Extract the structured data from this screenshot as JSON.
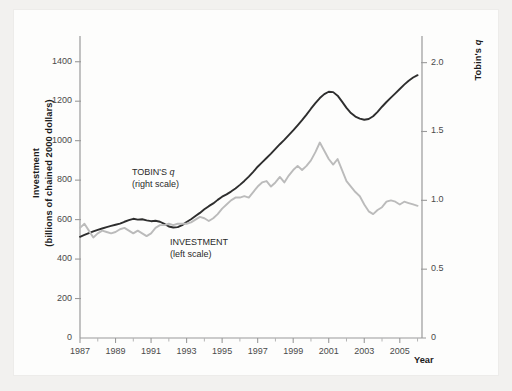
{
  "figure": {
    "background_color": "#fdfdfc",
    "page_color": "#f2f1ef"
  },
  "chart_data": {
    "type": "line",
    "title": "",
    "xlabel": "Year",
    "ylabel": "Investment (billions of chained 2000 dollars)",
    "ylabel_line1": "Investment",
    "ylabel_line2": "(billions of chained 2000 dollars)",
    "ylabel_right_prefix": "Tobin's ",
    "ylabel_right_italic": "q",
    "xlim": [
      1987,
      2006.25
    ],
    "ylim_left": [
      0,
      1500
    ],
    "ylim_right": [
      0,
      2.15
    ],
    "grid": false,
    "legend_position": "inline-annotations",
    "xticks": [
      "1987",
      "1989",
      "1991",
      "1993",
      "1995",
      "1997",
      "1999",
      "2001",
      "2003",
      "2005"
    ],
    "xtick_values": [
      1987,
      1989,
      1991,
      1993,
      1995,
      1997,
      1999,
      2001,
      2003,
      2005
    ],
    "xminor_values": [
      1988,
      1990,
      1992,
      1994,
      1996,
      1998,
      2000,
      2002,
      2004,
      2006
    ],
    "yticks_left": [
      "0",
      "200",
      "400",
      "600",
      "800",
      "1000",
      "1200",
      "1400"
    ],
    "ytick_left_values": [
      0,
      200,
      400,
      600,
      800,
      1000,
      1200,
      1400
    ],
    "yticks_right": [
      "0",
      "0.5",
      "1.0",
      "1.5",
      "2.0"
    ],
    "ytick_right_values": [
      0,
      0.5,
      1.0,
      1.5,
      2.0
    ],
    "series": [
      {
        "name": "INVESTMENT",
        "scale": "left",
        "annotation_line1": "INVESTMENT",
        "annotation_line2": "(left scale)",
        "color": "#2e2e2e",
        "width": 1.9,
        "x": [
          1987.0,
          1987.25,
          1987.5,
          1987.75,
          1988.0,
          1988.25,
          1988.5,
          1988.75,
          1989.0,
          1989.25,
          1989.5,
          1989.75,
          1990.0,
          1990.25,
          1990.5,
          1990.75,
          1991.0,
          1991.25,
          1991.5,
          1991.75,
          1992.0,
          1992.25,
          1992.5,
          1992.75,
          1993.0,
          1993.25,
          1993.5,
          1993.75,
          1994.0,
          1994.25,
          1994.5,
          1994.75,
          1995.0,
          1995.25,
          1995.5,
          1995.75,
          1996.0,
          1996.25,
          1996.5,
          1996.75,
          1997.0,
          1997.25,
          1997.5,
          1997.75,
          1998.0,
          1998.25,
          1998.5,
          1998.75,
          1999.0,
          1999.25,
          1999.5,
          1999.75,
          2000.0,
          2000.25,
          2000.5,
          2000.75,
          2001.0,
          2001.25,
          2001.5,
          2001.75,
          2002.0,
          2002.25,
          2002.5,
          2002.75,
          2003.0,
          2003.25,
          2003.5,
          2003.75,
          2004.0,
          2004.25,
          2004.5,
          2004.75,
          2005.0,
          2005.25,
          2005.5,
          2005.75,
          2006.0
        ],
        "y": [
          513,
          522,
          531,
          540,
          548,
          555,
          562,
          568,
          574,
          580,
          589,
          597,
          604,
          600,
          602,
          596,
          592,
          594,
          589,
          578,
          565,
          560,
          562,
          572,
          588,
          602,
          618,
          634,
          652,
          668,
          682,
          700,
          716,
          728,
          742,
          758,
          776,
          796,
          818,
          842,
          868,
          890,
          912,
          934,
          958,
          982,
          1004,
          1028,
          1052,
          1078,
          1104,
          1132,
          1162,
          1190,
          1216,
          1236,
          1248,
          1246,
          1228,
          1198,
          1166,
          1140,
          1122,
          1112,
          1106,
          1110,
          1124,
          1146,
          1172,
          1196,
          1218,
          1240,
          1262,
          1284,
          1304,
          1320,
          1332
        ]
      },
      {
        "name": "TOBIN'S q",
        "scale": "right",
        "annotation_line1_prefix": "TOBIN'S ",
        "annotation_line1_italic": "q",
        "annotation_line2": "(right scale)",
        "color": "#bbbbbb",
        "width": 1.9,
        "x": [
          1987.0,
          1987.25,
          1987.5,
          1987.75,
          1988.0,
          1988.25,
          1988.5,
          1988.75,
          1989.0,
          1989.25,
          1989.5,
          1989.75,
          1990.0,
          1990.25,
          1990.5,
          1990.75,
          1991.0,
          1991.25,
          1991.5,
          1991.75,
          1992.0,
          1992.25,
          1992.5,
          1992.75,
          1993.0,
          1993.25,
          1993.5,
          1993.75,
          1994.0,
          1994.25,
          1994.5,
          1994.75,
          1995.0,
          1995.25,
          1995.5,
          1995.75,
          1996.0,
          1996.25,
          1996.5,
          1996.75,
          1997.0,
          1997.25,
          1997.5,
          1997.75,
          1998.0,
          1998.25,
          1998.5,
          1998.75,
          1999.0,
          1999.25,
          1999.5,
          1999.75,
          2000.0,
          2000.25,
          2000.5,
          2000.75,
          2001.0,
          2001.25,
          2001.5,
          2001.75,
          2002.0,
          2002.25,
          2002.5,
          2002.75,
          2003.0,
          2003.25,
          2003.5,
          2003.75,
          2004.0,
          2004.25,
          2004.5,
          2004.75,
          2005.0,
          2005.25,
          2005.5,
          2005.75,
          2006.0
        ],
        "y": [
          0.8,
          0.83,
          0.78,
          0.73,
          0.76,
          0.78,
          0.77,
          0.76,
          0.77,
          0.79,
          0.8,
          0.78,
          0.76,
          0.78,
          0.76,
          0.74,
          0.76,
          0.8,
          0.82,
          0.82,
          0.83,
          0.82,
          0.83,
          0.83,
          0.83,
          0.84,
          0.86,
          0.88,
          0.87,
          0.85,
          0.87,
          0.9,
          0.94,
          0.97,
          1.0,
          1.02,
          1.02,
          1.03,
          1.02,
          1.06,
          1.1,
          1.13,
          1.14,
          1.1,
          1.13,
          1.17,
          1.13,
          1.18,
          1.22,
          1.25,
          1.22,
          1.25,
          1.29,
          1.35,
          1.42,
          1.36,
          1.3,
          1.26,
          1.3,
          1.22,
          1.14,
          1.1,
          1.06,
          1.03,
          0.97,
          0.92,
          0.9,
          0.93,
          0.95,
          0.99,
          1.0,
          0.99,
          0.97,
          0.99,
          0.98,
          0.97,
          0.96
        ]
      }
    ]
  }
}
